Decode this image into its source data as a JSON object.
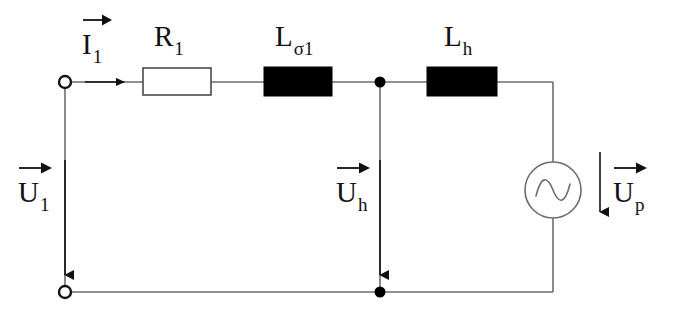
{
  "figure": {
    "name": "equivalent-circuit-diagram",
    "type": "electrical-schematic",
    "background_color": "#ffffff",
    "line_color": "#555555",
    "ink_color": "#111111",
    "fill_black": "#000000",
    "fill_white": "#ffffff"
  },
  "components": {
    "resistor": {
      "label_base": "R",
      "label_sub": "1",
      "style": "open-rectangle",
      "fill": "#ffffff"
    },
    "leakage_inductor": {
      "label_base": "L",
      "label_sub": "σ1",
      "style": "filled-rectangle",
      "fill": "#000000"
    },
    "main_inductor": {
      "label_base": "L",
      "label_sub": "h",
      "style": "filled-rectangle",
      "fill": "#000000"
    },
    "source": {
      "label_base": "U",
      "label_sub": "p",
      "symbol": "ac-source-sine",
      "style": "circle-with-sine"
    }
  },
  "quantities": {
    "input_current": {
      "base": "I",
      "sub": "1",
      "vector": true,
      "direction": "right"
    },
    "input_voltage": {
      "base": "U",
      "sub": "1",
      "vector": true,
      "direction": "down"
    },
    "magnetizing_voltage": {
      "base": "U",
      "sub": "h",
      "vector": true,
      "direction": "down"
    },
    "induced_voltage": {
      "base": "U",
      "sub": "p",
      "vector": true,
      "direction": "down"
    }
  },
  "terminals": {
    "top_left": "open-terminal",
    "bottom_left": "open-terminal"
  },
  "nodes": {
    "top_middle": "junction-dot",
    "bottom_middle": "junction-dot"
  }
}
